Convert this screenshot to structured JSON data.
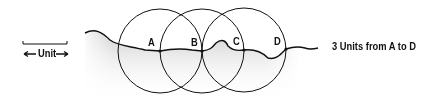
{
  "diagram": {
    "scale": {
      "label": "Unit"
    },
    "points": [
      {
        "label": "A",
        "x": 160,
        "y": 51
      },
      {
        "label": "B",
        "x": 202,
        "y": 51
      },
      {
        "label": "C",
        "x": 244,
        "y": 50
      },
      {
        "label": "D",
        "x": 286,
        "y": 49
      }
    ],
    "caption": "3 Units from A to D",
    "colors": {
      "line": "#111111",
      "shade": "#d9d9d9"
    }
  }
}
